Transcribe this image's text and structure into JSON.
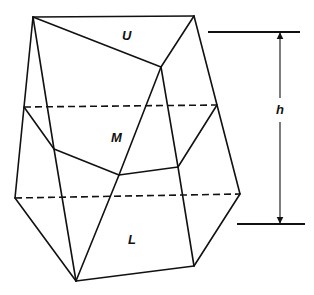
{
  "figure": {
    "labels": {
      "upper": "U",
      "middle": "M",
      "lower": "L",
      "height": "h"
    },
    "colors": {
      "line": "#111111",
      "background": "#ffffff"
    }
  }
}
